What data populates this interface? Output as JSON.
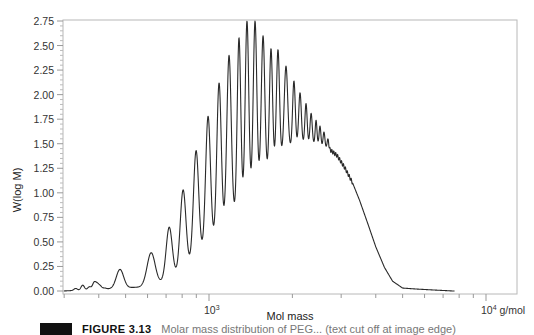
{
  "chart_data": {
    "type": "line",
    "title": "",
    "xlabel": "Mol mass",
    "ylabel": "W(log M)",
    "x_scale": "log",
    "x_unit": "g/mol",
    "xlim": [
      297,
      12900
    ],
    "ylim": [
      0,
      2.75
    ],
    "grid": false,
    "legend": "none",
    "y_ticks": [
      "0.00",
      "0.25",
      "0.50",
      "0.75",
      "1.00",
      "1.25",
      "1.50",
      "1.75",
      "2.00",
      "2.25",
      "2.50",
      "2.75"
    ],
    "x_tick_labels": [
      {
        "value": 1000,
        "label": "10",
        "exp": "3",
        "suffix": ""
      },
      {
        "value": 10000,
        "label": "10",
        "exp": "4",
        "suffix": " g/mol"
      }
    ],
    "series": [
      {
        "name": "Oligomer distribution",
        "description": "Resolved oligomer peaks on a broad envelope, max ~2.75 near 1400-1470 g/mol, tailing to baseline near 6000 g/mol",
        "peaks": [
          {
            "M": 477,
            "h": 0.22
          },
          {
            "M": 618,
            "h": 0.39
          },
          {
            "M": 718,
            "h": 0.65
          },
          {
            "M": 806,
            "h": 1.03
          },
          {
            "M": 898,
            "h": 1.43
          },
          {
            "M": 992,
            "h": 1.78
          },
          {
            "M": 1087,
            "h": 2.12
          },
          {
            "M": 1181,
            "h": 2.4
          },
          {
            "M": 1283,
            "h": 2.58
          },
          {
            "M": 1371,
            "h": 2.75
          },
          {
            "M": 1466,
            "h": 2.75
          },
          {
            "M": 1567,
            "h": 2.6
          },
          {
            "M": 1674,
            "h": 2.47
          },
          {
            "M": 1774,
            "h": 2.46
          },
          {
            "M": 1896,
            "h": 2.29
          },
          {
            "M": 2026,
            "h": 2.14
          },
          {
            "M": 2131,
            "h": 2.02
          },
          {
            "M": 2240,
            "h": 1.91
          },
          {
            "M": 2337,
            "h": 1.81
          },
          {
            "M": 2435,
            "h": 1.74
          },
          {
            "M": 2516,
            "h": 1.68
          },
          {
            "M": 2601,
            "h": 1.62
          },
          {
            "M": 2688,
            "h": 1.55
          }
        ],
        "envelope": [
          {
            "M": 297,
            "h": 0.0
          },
          {
            "M": 420,
            "h": 0.02
          },
          {
            "M": 560,
            "h": 0.04
          },
          {
            "M": 700,
            "h": 0.1
          },
          {
            "M": 800,
            "h": 0.2
          },
          {
            "M": 900,
            "h": 0.32
          },
          {
            "M": 1000,
            "h": 0.45
          },
          {
            "M": 1100,
            "h": 0.58
          },
          {
            "M": 1200,
            "h": 0.72
          },
          {
            "M": 1300,
            "h": 0.86
          },
          {
            "M": 1400,
            "h": 0.98
          },
          {
            "M": 1500,
            "h": 1.08
          },
          {
            "M": 1600,
            "h": 1.18
          },
          {
            "M": 1700,
            "h": 1.28
          },
          {
            "M": 1800,
            "h": 1.36
          },
          {
            "M": 1900,
            "h": 1.42
          },
          {
            "M": 2000,
            "h": 1.47
          },
          {
            "M": 2200,
            "h": 1.5
          },
          {
            "M": 2450,
            "h": 1.5
          },
          {
            "M": 2700,
            "h": 1.45
          },
          {
            "M": 2900,
            "h": 1.38
          },
          {
            "M": 3100,
            "h": 1.25
          },
          {
            "M": 3300,
            "h": 1.1
          },
          {
            "M": 3500,
            "h": 0.92
          },
          {
            "M": 3750,
            "h": 0.68
          },
          {
            "M": 4000,
            "h": 0.45
          },
          {
            "M": 4300,
            "h": 0.24
          },
          {
            "M": 4600,
            "h": 0.1
          },
          {
            "M": 5000,
            "h": 0.03
          },
          {
            "M": 5600,
            "h": 0.02
          },
          {
            "M": 6500,
            "h": 0.01
          },
          {
            "M": 7600,
            "h": 0.0
          }
        ],
        "low_mass_noise": [
          {
            "M": 330,
            "h": 0.02
          },
          {
            "M": 350,
            "h": 0.05
          },
          {
            "M": 370,
            "h": 0.03
          },
          {
            "M": 385,
            "h": 0.07
          },
          {
            "M": 395,
            "h": 0.05
          },
          {
            "M": 405,
            "h": 0.03
          },
          {
            "M": 420,
            "h": 0.01
          }
        ]
      }
    ]
  },
  "caption": {
    "label": "FIGURE 3.13",
    "text": "Molar mass distribution of PEG... (text cut off at image edge)"
  }
}
